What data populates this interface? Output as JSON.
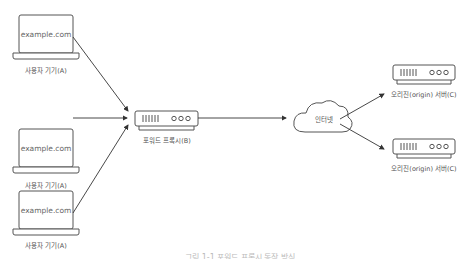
{
  "devices": [
    {
      "screen": "example.com",
      "label": "사용자 기기(A)"
    },
    {
      "screen": "example.com",
      "label": "사용자 기기(A)"
    },
    {
      "screen": "example.com",
      "label": "사용자 기기(A)"
    }
  ],
  "proxy": {
    "label": "포워드 프록시(B)"
  },
  "internet": {
    "label": "인터넷"
  },
  "origins": [
    {
      "label": "오리진(origin) 서버(C)"
    },
    {
      "label": "오리진(origin) 서버(C)"
    }
  ],
  "caption": "그림 1-1 포워드 프록시 동작 방식",
  "colors": {
    "stroke": "#555555",
    "text": "#555555",
    "background": "#ffffff"
  }
}
